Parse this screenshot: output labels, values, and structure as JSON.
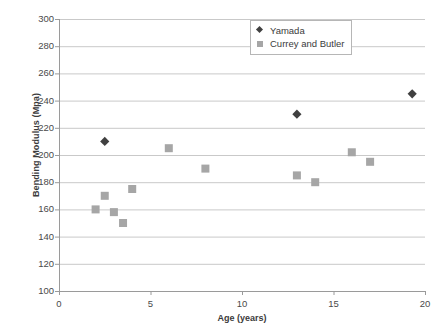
{
  "chart_data": {
    "type": "scatter",
    "title": "",
    "xlabel": "Age (years)",
    "ylabel": "Bending Modulus (Mpa)",
    "xlim": [
      0,
      20
    ],
    "ylim": [
      100,
      300
    ],
    "xticks": [
      0,
      5,
      10,
      15,
      20
    ],
    "yticks": [
      100,
      120,
      140,
      160,
      180,
      200,
      220,
      240,
      260,
      280,
      300
    ],
    "grid": "horizontal",
    "legend_position": "top-right-inside",
    "series": [
      {
        "name": "Yamada",
        "marker": "diamond",
        "color": "#404040",
        "points": [
          {
            "x": 2.5,
            "y": 210
          },
          {
            "x": 13.0,
            "y": 230
          },
          {
            "x": 19.3,
            "y": 245
          }
        ]
      },
      {
        "name": "Currey and Butler",
        "marker": "square",
        "color": "#a6a6a6",
        "points": [
          {
            "x": 2.0,
            "y": 160
          },
          {
            "x": 2.5,
            "y": 170
          },
          {
            "x": 3.0,
            "y": 158
          },
          {
            "x": 3.5,
            "y": 150
          },
          {
            "x": 4.0,
            "y": 175
          },
          {
            "x": 6.0,
            "y": 205
          },
          {
            "x": 8.0,
            "y": 190
          },
          {
            "x": 13.0,
            "y": 185
          },
          {
            "x": 14.0,
            "y": 180
          },
          {
            "x": 16.0,
            "y": 202
          },
          {
            "x": 17.0,
            "y": 195
          }
        ]
      }
    ]
  },
  "axes": {
    "x_title": "Age (years)",
    "y_title": "Bending Modulus (Mpa)"
  },
  "legend": {
    "entries": [
      {
        "label": "Yamada",
        "marker": "diamond-icon"
      },
      {
        "label": "Currey and Butler",
        "marker": "square-icon"
      }
    ]
  },
  "style": {
    "gridline_color": "#c9c9c9",
    "axis_color": "#9a9a9a",
    "text_color": "#3b3b3b",
    "plot_background": "#ffffff"
  }
}
